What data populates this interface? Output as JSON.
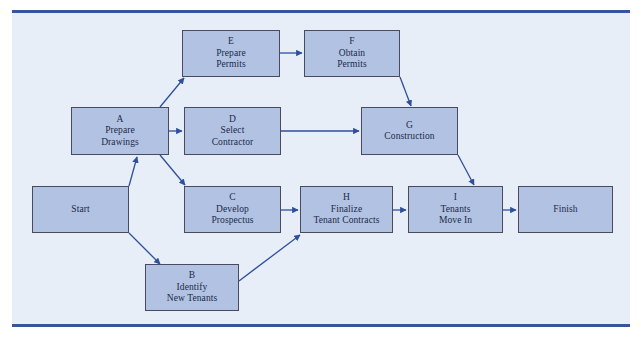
{
  "diagram": {
    "colors": {
      "node_fill": "#b2c2e2",
      "node_border": "#4a4a5e",
      "canvas_bg": "#e8eef8",
      "rule": "#36559c",
      "arrow": "#2e4f9e",
      "text": "#1b2a4a"
    },
    "nodes": [
      {
        "id": "E",
        "lines": [
          "E",
          "Prepare",
          "Permits"
        ],
        "x": 182,
        "y": 30,
        "w": 98,
        "h": 47
      },
      {
        "id": "F",
        "lines": [
          "F",
          "Obtain",
          "Permits"
        ],
        "x": 304,
        "y": 30,
        "w": 96,
        "h": 47
      },
      {
        "id": "A",
        "lines": [
          "A",
          "Prepare",
          "Drawings"
        ],
        "x": 71,
        "y": 107,
        "w": 98,
        "h": 48
      },
      {
        "id": "D",
        "lines": [
          "D",
          "Select",
          "Contractor"
        ],
        "x": 184,
        "y": 107,
        "w": 97,
        "h": 48
      },
      {
        "id": "G",
        "lines": [
          "G",
          "Construction"
        ],
        "x": 361,
        "y": 107,
        "w": 97,
        "h": 48
      },
      {
        "id": "Start",
        "lines": [
          "Start"
        ],
        "x": 32,
        "y": 186,
        "w": 97,
        "h": 47
      },
      {
        "id": "C",
        "lines": [
          "C",
          "Develop",
          "Prospectus"
        ],
        "x": 184,
        "y": 186,
        "w": 97,
        "h": 47
      },
      {
        "id": "H",
        "lines": [
          "H",
          "Finalize",
          "Tenant Contracts"
        ],
        "x": 300,
        "y": 186,
        "w": 93,
        "h": 47
      },
      {
        "id": "I",
        "lines": [
          "I",
          "Tenants",
          "Move In"
        ],
        "x": 408,
        "y": 186,
        "w": 95,
        "h": 47
      },
      {
        "id": "Finish",
        "lines": [
          "Finish"
        ],
        "x": 518,
        "y": 186,
        "w": 95,
        "h": 47
      },
      {
        "id": "B",
        "lines": [
          "B",
          "Identify",
          "New Tenants"
        ],
        "x": 145,
        "y": 264,
        "w": 94,
        "h": 47
      }
    ],
    "edges": [
      {
        "from": "Start",
        "to": "A",
        "x1": 129,
        "y1": 186,
        "x2": 137,
        "y2": 157
      },
      {
        "from": "Start",
        "to": "B",
        "x1": 129,
        "y1": 233,
        "x2": 160,
        "y2": 264
      },
      {
        "from": "A",
        "to": "E",
        "x1": 160,
        "y1": 107,
        "x2": 184,
        "y2": 78
      },
      {
        "from": "A",
        "to": "D",
        "x1": 169,
        "y1": 131,
        "x2": 182,
        "y2": 131
      },
      {
        "from": "A",
        "to": "C",
        "x1": 160,
        "y1": 155,
        "x2": 185,
        "y2": 185
      },
      {
        "from": "E",
        "to": "F",
        "x1": 280,
        "y1": 53,
        "x2": 302,
        "y2": 53
      },
      {
        "from": "F",
        "to": "G",
        "x1": 400,
        "y1": 77,
        "x2": 411,
        "y2": 106
      },
      {
        "from": "D",
        "to": "G",
        "x1": 281,
        "y1": 131,
        "x2": 359,
        "y2": 131
      },
      {
        "from": "G",
        "to": "I",
        "x1": 458,
        "y1": 155,
        "x2": 474,
        "y2": 185
      },
      {
        "from": "C",
        "to": "H",
        "x1": 281,
        "y1": 210,
        "x2": 298,
        "y2": 210
      },
      {
        "from": "B",
        "to": "H",
        "x1": 239,
        "y1": 281,
        "x2": 300,
        "y2": 235
      },
      {
        "from": "H",
        "to": "I",
        "x1": 393,
        "y1": 210,
        "x2": 406,
        "y2": 210
      },
      {
        "from": "I",
        "to": "Finish",
        "x1": 503,
        "y1": 210,
        "x2": 516,
        "y2": 210
      }
    ]
  }
}
